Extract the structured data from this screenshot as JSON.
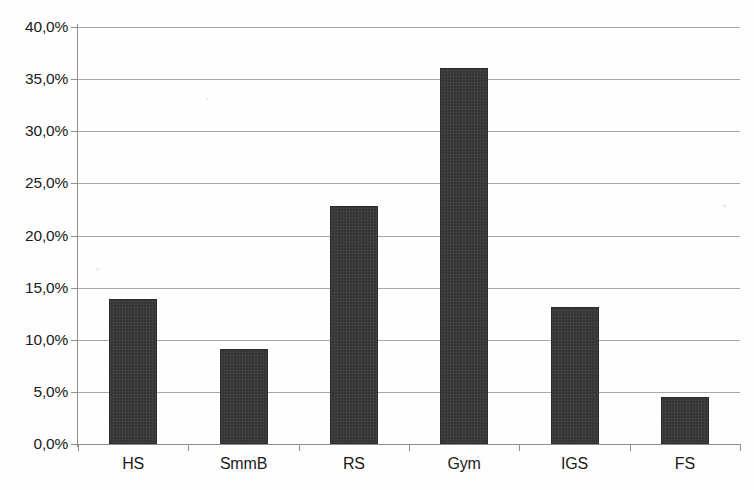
{
  "chart_data": {
    "type": "bar",
    "title": "",
    "subtitle": "",
    "xlabel": "",
    "ylabel": "",
    "categories": [
      "HS",
      "SmmB",
      "RS",
      "Gym",
      "IGS",
      "FS"
    ],
    "values": [
      13.9,
      9.1,
      22.8,
      36.1,
      13.1,
      4.5
    ],
    "value_unit": "%",
    "ylim": [
      0,
      40
    ],
    "ytick_step": 5,
    "ytick_labels": [
      "0,0%",
      "5,0%",
      "10,0%",
      "15,0%",
      "20,0%",
      "25,0%",
      "30,0%",
      "35,0%",
      "40,0%"
    ],
    "ytick_values": [
      0,
      5,
      10,
      15,
      20,
      25,
      30,
      35,
      40
    ],
    "grid": true,
    "grid_axis": "y",
    "legend": false,
    "legend_position": "none",
    "series": [
      {
        "name": "Anteil",
        "values": [
          13.9,
          9.1,
          22.8,
          36.1,
          13.1,
          4.5
        ]
      }
    ],
    "colors": {
      "bar_fill": "#343434",
      "bar_border": "#2b2b2b",
      "gridline": "#a9a9a9",
      "axis": "#8d8d8d",
      "text": "#1a1a1a",
      "background": "#fefefe"
    },
    "annotations": []
  }
}
